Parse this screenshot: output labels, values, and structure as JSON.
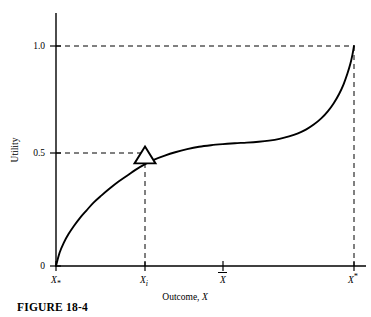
{
  "figure": {
    "caption": "FIGURE 18-4"
  },
  "chart_data": {
    "type": "line",
    "title": "",
    "xlabel": "Outcome, X",
    "ylabel": "Utility",
    "grid": false,
    "legend": null,
    "xlim": [
      0,
      1
    ],
    "ylim": [
      0,
      1.08
    ],
    "x_tick_labels": [
      {
        "label": "X",
        "sub": "*",
        "sup": "",
        "pos": 0.0,
        "name": "x-tick-x-min"
      },
      {
        "label": "X",
        "sub": "i",
        "sup": "",
        "pos": 0.2987,
        "name": "x-tick-x-i"
      },
      {
        "label": "X",
        "sub": "",
        "sup": "",
        "overbar": true,
        "pos": 0.5604,
        "name": "x-tick-x-bar"
      },
      {
        "label": "X",
        "sub": "",
        "sup": "*",
        "pos": 1.0,
        "name": "x-tick-x-max"
      }
    ],
    "y_tick_labels": [
      {
        "label": "0",
        "value": 0.0
      },
      {
        "label": "0.5",
        "value": 0.5
      },
      {
        "label": "1.0",
        "value": 1.0
      }
    ],
    "series": [
      {
        "name": "utility-curve",
        "color": "#000000",
        "points_x": [
          0.0,
          0.012,
          0.026,
          0.042,
          0.06,
          0.08,
          0.102,
          0.126,
          0.152,
          0.18,
          0.21,
          0.242,
          0.268,
          0.299,
          0.33,
          0.365,
          0.4,
          0.44,
          0.48,
          0.52,
          0.56,
          0.6,
          0.64,
          0.68,
          0.715,
          0.75,
          0.782,
          0.812,
          0.84,
          0.866,
          0.89,
          0.912,
          0.932,
          0.95,
          0.965,
          0.978,
          0.988,
          0.995,
          1.0
        ],
        "points_y": [
          0.0,
          0.06,
          0.105,
          0.145,
          0.182,
          0.218,
          0.252,
          0.288,
          0.32,
          0.352,
          0.384,
          0.414,
          0.438,
          0.463,
          0.484,
          0.502,
          0.517,
          0.531,
          0.542,
          0.549,
          0.554,
          0.558,
          0.561,
          0.565,
          0.57,
          0.578,
          0.589,
          0.603,
          0.621,
          0.644,
          0.671,
          0.703,
          0.74,
          0.782,
          0.826,
          0.875,
          0.92,
          0.962,
          1.0
        ]
      }
    ],
    "markers": [
      {
        "name": "triangle-marker",
        "shape": "triangle-open",
        "x": 0.2987,
        "y": 0.5,
        "fill": "none",
        "stroke": "#000000"
      }
    ],
    "annotations": [
      {
        "name": "dashed-guide-utility-0.5",
        "type": "dashed-horizontal",
        "y": 0.5,
        "from_x": 0.0,
        "to_x": 0.2987
      },
      {
        "name": "dashed-guide-x-i",
        "type": "dashed-vertical",
        "x": 0.2987,
        "from_y": 0.0,
        "to_y": 0.5
      },
      {
        "name": "dashed-guide-utility-1.0",
        "type": "dashed-horizontal",
        "y": 1.0,
        "from_x": 0.0,
        "to_x": 1.0
      },
      {
        "name": "dashed-guide-x-max",
        "type": "dashed-vertical",
        "x": 1.0,
        "from_y": 0.0,
        "to_y": 1.0
      }
    ],
    "colors": {
      "curve": "#000000",
      "axis": "#000000",
      "dashed_guide": "#000000",
      "background": "#ffffff"
    }
  }
}
